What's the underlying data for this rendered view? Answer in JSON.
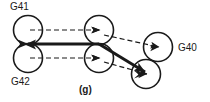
{
  "figure": {
    "caption": "(g)",
    "background_color": "#ffffff",
    "stroke_color": "#1a1a1a",
    "labels": {
      "top_left": "G41",
      "bottom_left": "G42",
      "right": "G40"
    },
    "nodes": [
      {
        "id": "g41-start",
        "name": "upper-left-circle",
        "cx": 28,
        "cy": 30,
        "r": 14.5
      },
      {
        "id": "g42-start",
        "name": "lower-left-circle",
        "cx": 28,
        "cy": 58,
        "r": 14.5
      },
      {
        "id": "g41-mid",
        "name": "upper-middle-circle",
        "cx": 99,
        "cy": 30,
        "r": 14.5
      },
      {
        "id": "g42-mid",
        "name": "lower-middle-circle",
        "cx": 99,
        "cy": 58,
        "r": 14.5
      },
      {
        "id": "g40-upper",
        "name": "upper-right-circle",
        "cx": 158,
        "cy": 47,
        "r": 14.5
      },
      {
        "id": "g40-lower",
        "name": "lower-right-circle",
        "cx": 146,
        "cy": 74,
        "r": 14.5
      }
    ],
    "dashed_arrows": [
      {
        "name": "arrow-g41-to-middle",
        "x1": 30,
        "y1": 30,
        "x2": 100,
        "y2": 30
      },
      {
        "name": "arrow-g42-to-middle",
        "x1": 30,
        "y1": 58,
        "x2": 100,
        "y2": 58
      },
      {
        "name": "arrow-upper-mid-to-g40",
        "x1": 101,
        "y1": 35,
        "x2": 157,
        "y2": 47
      },
      {
        "name": "arrow-lower-mid-to-g40",
        "x1": 101,
        "y1": 62,
        "x2": 145,
        "y2": 74
      }
    ],
    "solid_connectors": [
      {
        "name": "solid-line-left-to-middle",
        "x1": 28,
        "y1": 44,
        "x2": 99,
        "y2": 44,
        "width": 3
      },
      {
        "name": "solid-line-middle-to-g40",
        "x1": 99,
        "y1": 44,
        "x2": 146,
        "y2": 72,
        "width": 3
      }
    ],
    "line_styles": {
      "dashed_dash": "5,3",
      "dashed_width": 1.2,
      "circle_width": 1.6,
      "solid_width": 3
    }
  }
}
